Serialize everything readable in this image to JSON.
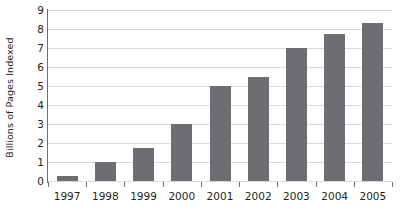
{
  "chart_data": {
    "type": "bar",
    "title": "",
    "xlabel": "",
    "ylabel": "Billions of Pages Indexed",
    "categories": [
      "1997",
      "1998",
      "1999",
      "2000",
      "2001",
      "2002",
      "2003",
      "2004",
      "2005"
    ],
    "values": [
      0.25,
      1.0,
      1.75,
      3.0,
      5.0,
      5.5,
      7.0,
      7.75,
      8.3
    ],
    "ylim": [
      0,
      9
    ],
    "ytick_labels": [
      "0",
      "1",
      "2",
      "3",
      "4",
      "5",
      "6",
      "7",
      "8",
      "9"
    ],
    "ytick_values": [
      0,
      1,
      2,
      3,
      4,
      5,
      6,
      7,
      8,
      9
    ],
    "grid": true,
    "legend": "none",
    "series": [
      {
        "name": "Billions of Pages Indexed",
        "color": "#6d6e71",
        "values": [
          0.25,
          1.0,
          1.75,
          3.0,
          5.0,
          5.5,
          7.0,
          7.75,
          8.3
        ]
      }
    ],
    "colors": {
      "bar": "#6d6e71",
      "grid": "#d9d9d9",
      "axis": "#6d6e71",
      "text": "#231f20",
      "background": "#ffffff"
    }
  }
}
